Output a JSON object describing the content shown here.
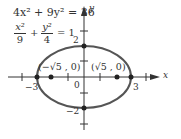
{
  "equations": {
    "standard_form": "4x² + 9y² = 36",
    "normalized_num_x": "x²",
    "normalized_den_x": "9",
    "normalized_num_y": "y²",
    "normalized_den_y": "4",
    "normalized_plus": "+",
    "normalized_rhs": "= 1"
  },
  "axes": {
    "x_label": "x",
    "y_label": "y",
    "origin_label": "0"
  },
  "ticks": {
    "x_neg": "−3",
    "x_pos": "3",
    "y_pos": "2",
    "y_neg": "−2"
  },
  "foci": {
    "left": "(−√5 , 0)",
    "right": "(√5 , 0)"
  },
  "colors": {
    "ellipse": "#555555",
    "axes": "#333333",
    "text": "#333333"
  }
}
